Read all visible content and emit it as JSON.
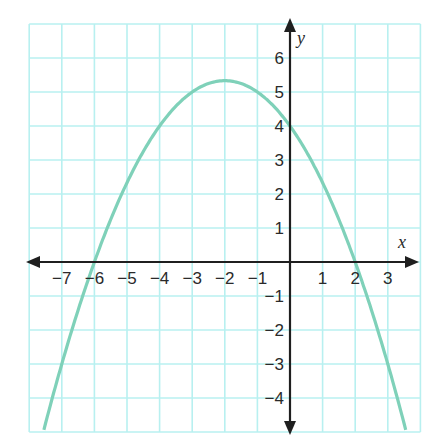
{
  "chart_data": {
    "type": "line",
    "title": "",
    "xlabel": "x",
    "ylabel": "y",
    "xlim": [
      -8,
      4
    ],
    "ylim": [
      -5,
      7
    ],
    "grid": true,
    "x_tick_labels": [
      "−7",
      "−6",
      "−5",
      "−4",
      "−3",
      "−2",
      "−1",
      "1",
      "2",
      "3"
    ],
    "x_ticks": [
      -7,
      -6,
      -5,
      -4,
      -3,
      -2,
      -1,
      1,
      2,
      3
    ],
    "y_tick_labels": [
      "6",
      "5",
      "4",
      "3",
      "2",
      "1",
      "−1",
      "−2",
      "−3",
      "−4"
    ],
    "y_ticks": [
      6,
      5,
      4,
      3,
      2,
      1,
      -1,
      -2,
      -3,
      -4
    ],
    "series": [
      {
        "name": "parabola",
        "equation": "y = -(1/3)(x + 6)(x - 2)",
        "x": [
          -7.5,
          -7,
          -6,
          -5,
          -4,
          -3,
          -2,
          -1,
          0,
          1,
          2,
          3,
          3.5
        ],
        "y": [
          -3.25,
          -1.67,
          0,
          1.67,
          4.0,
          5.0,
          5.33,
          5.0,
          4.0,
          2.33,
          0,
          -3.0,
          -3.25
        ],
        "vertex": [
          -2,
          5.33
        ],
        "x_intercepts": [
          -6,
          2
        ],
        "y_intercept": 4
      }
    ]
  },
  "colors": {
    "grid": "#b8f0f0",
    "curve": "#7fd1b9",
    "axis": "#1f1f1f",
    "text": "#2a2a2a"
  }
}
